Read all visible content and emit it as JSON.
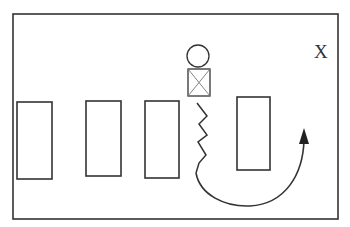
{
  "diagram": {
    "frame": {
      "x": 13,
      "y": 14,
      "width": 325,
      "height": 205
    },
    "stroke_color": "#333333",
    "label": {
      "text": "X",
      "x": 314,
      "y": 58
    },
    "blocks": [
      {
        "x": 17,
        "y": 102,
        "width": 35,
        "height": 77
      },
      {
        "x": 86,
        "y": 101,
        "width": 35,
        "height": 75
      },
      {
        "x": 145,
        "y": 101,
        "width": 34,
        "height": 77
      },
      {
        "x": 237,
        "y": 97,
        "width": 33,
        "height": 73
      }
    ],
    "figure": {
      "head": {
        "cx": 198,
        "cy": 56,
        "r": 11
      },
      "body_box": {
        "x": 188,
        "y": 69,
        "width": 22,
        "height": 27
      }
    },
    "path_shape": "zigzag-then-curved-arrow"
  }
}
